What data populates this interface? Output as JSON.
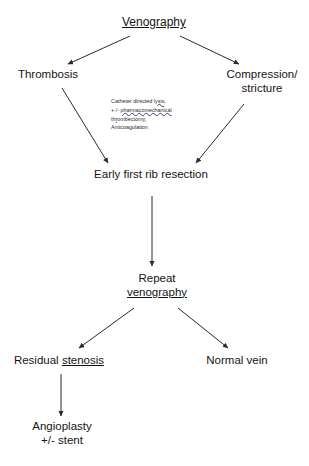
{
  "diagram": {
    "title_node": {
      "label": "Venography",
      "underlined": true
    },
    "nodes": [
      {
        "id": "venography",
        "label": "Venography"
      },
      {
        "id": "thrombosis",
        "label": "Thrombosis"
      },
      {
        "id": "compression_line1",
        "label": "Compression/"
      },
      {
        "id": "compression_line2",
        "label": "stricture"
      },
      {
        "id": "early_rib_resection",
        "label": "Early first rib resection"
      },
      {
        "id": "repeat_line1",
        "label": "Repeat"
      },
      {
        "id": "repeat_line2",
        "label": "venography"
      },
      {
        "id": "residual_stenosis_plain",
        "label": "Residual "
      },
      {
        "id": "residual_stenosis_underlined",
        "label": "stenosis"
      },
      {
        "id": "normal_vein",
        "label": "Normal vein"
      },
      {
        "id": "angioplasty_line1",
        "label": "Angioplasty"
      },
      {
        "id": "angioplasty_line2",
        "label": "+/- stent"
      }
    ],
    "annotation": {
      "line1_plain": "Catheter directed ",
      "line1_marked": "lysis,",
      "line2_plain": "+ /- ",
      "line2_marked": "pharmacomechanical",
      "line3_marked": "thrombectomy,",
      "line4_plain": "Anticoagulation"
    },
    "colors": {
      "background": "#ffffff",
      "text": "#141414",
      "arrow": "#2b2b2b",
      "spellcheck_underline": "#3a3a8a"
    },
    "edges": [
      {
        "from": "venography",
        "to": "thrombosis"
      },
      {
        "from": "venography",
        "to": "compression"
      },
      {
        "from": "thrombosis",
        "to": "early_rib_resection"
      },
      {
        "from": "compression",
        "to": "early_rib_resection"
      },
      {
        "from": "early_rib_resection",
        "to": "repeat_venography"
      },
      {
        "from": "repeat_venography",
        "to": "residual_stenosis"
      },
      {
        "from": "repeat_venography",
        "to": "normal_vein"
      },
      {
        "from": "residual_stenosis",
        "to": "angioplasty"
      }
    ]
  }
}
